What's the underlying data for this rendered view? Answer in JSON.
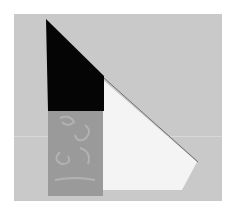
{
  "scene": {
    "description": "Photo of tangram-like paper shapes arranged on a gray surface",
    "colors": {
      "background": "#ffffff",
      "panel": "#c9c9c9",
      "black_shape": "#050505",
      "gray_shape": "#9a9a9a",
      "swirl": "#b8b8b8",
      "white_shape": "#f4f4f4",
      "edge_shadow": "#6e6e6e"
    },
    "shapes": [
      {
        "name": "black-trapezoid",
        "points": "46,19 104,76 104,111 48,111"
      },
      {
        "name": "gray-swirl-rectangle",
        "points": "48,111 103,111 103,196 48,196"
      },
      {
        "name": "white-pentagon",
        "points": "103,80 197,162 182,190 103,190"
      }
    ]
  }
}
